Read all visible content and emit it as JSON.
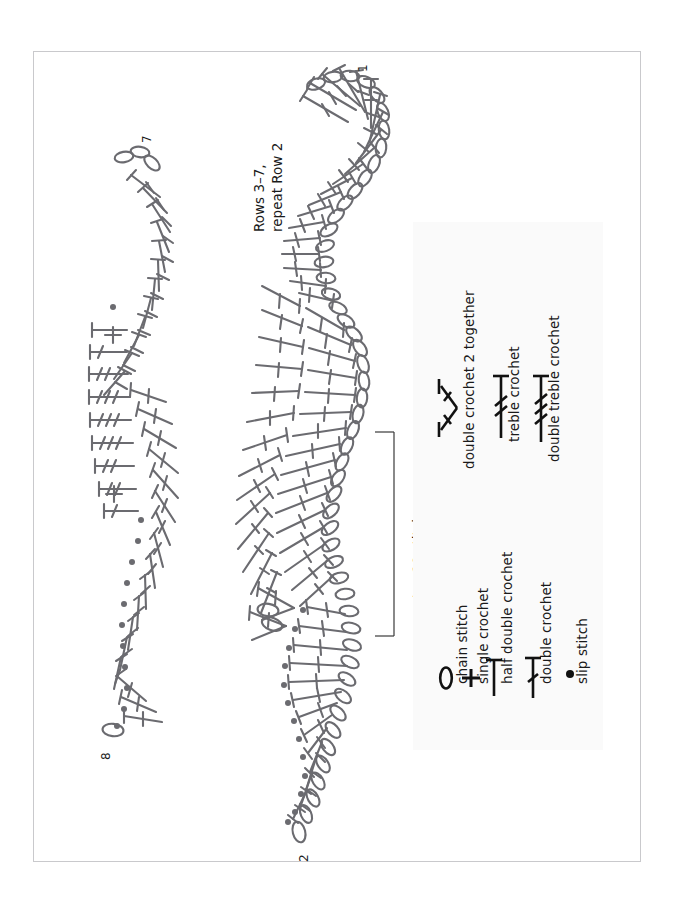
{
  "document": {
    "type": "crochet-stitch-chart",
    "orientation": "landscape-content-on-portrait-page",
    "page_width": 673,
    "page_height": 906,
    "background_color": "#ffffff",
    "border_color": "#c9c9cc",
    "stitch_stroke_color": "#6b6b70",
    "legend_background": "#fafafa",
    "legend_stroke_color": "#111111"
  },
  "annotations": {
    "row_1_label": "1",
    "row_2_label": "2",
    "row_7_label": "7",
    "row_8_label": "8",
    "rows_note_line1": "Rows 3–7,",
    "rows_note_line2": "repeat Row 2",
    "repeat_note": "repeat = 10 stitches"
  },
  "legend": {
    "title": "",
    "items": [
      {
        "symbol": "chain-stitch-oval",
        "label": "chain stitch"
      },
      {
        "symbol": "single-crochet-plus",
        "label": "single crochet"
      },
      {
        "symbol": "half-double-crochet-tee",
        "label": "half double crochet"
      },
      {
        "symbol": "double-crochet-one-bar",
        "label": "double crochet"
      },
      {
        "symbol": "slip-stitch-dot",
        "label": "slip stitch"
      },
      {
        "symbol": "double-crochet-2-together-cluster",
        "label": "double crochet 2 together"
      },
      {
        "symbol": "treble-crochet-two-bars",
        "label": "treble crochet"
      },
      {
        "symbol": "double-treble-crochet-three-bars",
        "label": "double treble crochet"
      }
    ]
  },
  "charts": {
    "right_chart": {
      "name": "rows-1-through-7-chart",
      "description": "Wavy crochet chart, chain base with fans of double/treble crochet"
    },
    "left_chart": {
      "name": "rows-7-and-8-chart",
      "description": "Upper wavy crochet chart with treble and double treble clusters"
    }
  }
}
